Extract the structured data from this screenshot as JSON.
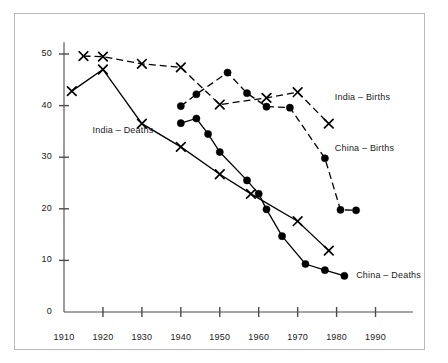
{
  "chart_data": {
    "type": "line",
    "title": "",
    "subtitle": "",
    "xlabel": "",
    "ylabel": "",
    "xlim": [
      1910,
      1995
    ],
    "ylim": [
      0,
      52
    ],
    "xticks": [
      1910,
      1920,
      1930,
      1940,
      1950,
      1960,
      1970,
      1980,
      1990
    ],
    "yticks": [
      0,
      10,
      20,
      30,
      40,
      50
    ],
    "grid": false,
    "legend_position": "inline-annotations",
    "series": [
      {
        "name": "India – Births",
        "marker": "x",
        "linestyle": "dashed",
        "color": "#000000",
        "label_x": 1978,
        "label_y": 41.5,
        "points": [
          {
            "x": 1915,
            "y": 49.6
          },
          {
            "x": 1920,
            "y": 49.5
          },
          {
            "x": 1930,
            "y": 48.1
          },
          {
            "x": 1940,
            "y": 47.4
          },
          {
            "x": 1950,
            "y": 40.2
          },
          {
            "x": 1962,
            "y": 41.5
          },
          {
            "x": 1970,
            "y": 42.6
          },
          {
            "x": 1978,
            "y": 36.5
          }
        ]
      },
      {
        "name": "India – Deaths",
        "marker": "x",
        "linestyle": "solid",
        "color": "#000000",
        "label_x": 1924,
        "label_y": 35.0,
        "points": [
          {
            "x": 1912,
            "y": 42.8
          },
          {
            "x": 1920,
            "y": 47.0
          },
          {
            "x": 1930,
            "y": 36.5
          },
          {
            "x": 1940,
            "y": 32.0
          },
          {
            "x": 1950,
            "y": 26.7
          },
          {
            "x": 1958,
            "y": 22.9
          },
          {
            "x": 1970,
            "y": 17.6
          },
          {
            "x": 1978,
            "y": 11.9
          }
        ]
      },
      {
        "name": "China – Births",
        "marker": "circle",
        "linestyle": "dashed",
        "color": "#000000",
        "label_x": 1978,
        "label_y": 31.5,
        "points": [
          {
            "x": 1940,
            "y": 39.9
          },
          {
            "x": 1944,
            "y": 42.2
          },
          {
            "x": 1952,
            "y": 46.4
          },
          {
            "x": 1957,
            "y": 42.4
          },
          {
            "x": 1962,
            "y": 39.8
          },
          {
            "x": 1968,
            "y": 39.6
          },
          {
            "x": 1977,
            "y": 29.8
          },
          {
            "x": 1981,
            "y": 19.8
          },
          {
            "x": 1985,
            "y": 19.7
          }
        ]
      },
      {
        "name": "China – Deaths",
        "marker": "circle",
        "linestyle": "solid",
        "color": "#000000",
        "label_x": 1984,
        "label_y": 7.0,
        "points": [
          {
            "x": 1940,
            "y": 36.6
          },
          {
            "x": 1944,
            "y": 37.5
          },
          {
            "x": 1947,
            "y": 34.5
          },
          {
            "x": 1950,
            "y": 31.0
          },
          {
            "x": 1957,
            "y": 25.5
          },
          {
            "x": 1960,
            "y": 22.9
          },
          {
            "x": 1962,
            "y": 19.9
          },
          {
            "x": 1966,
            "y": 14.7
          },
          {
            "x": 1972,
            "y": 9.3
          },
          {
            "x": 1977,
            "y": 8.1
          },
          {
            "x": 1982,
            "y": 7.0
          }
        ]
      }
    ]
  },
  "colors": {
    "axis": "#4a4a4a",
    "series": "#000000",
    "frame_border": "#b9b9bb",
    "background": "#ffffff",
    "text": "#1a1a1a"
  }
}
